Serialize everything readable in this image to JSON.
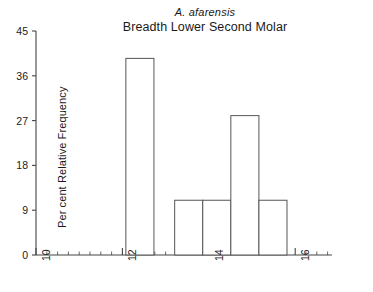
{
  "chart_data": {
    "type": "bar",
    "title": "Breadth Lower Second Molar",
    "subtitle": "A. afarensis",
    "xlabel": "",
    "ylabel": "Per cent Relative Frequency",
    "xlim": [
      10,
      16.85
    ],
    "ylim": [
      0,
      45
    ],
    "grid": false,
    "legend": null,
    "xticks": [
      10,
      12,
      14,
      16
    ],
    "xtick_labels": [
      "10",
      "12",
      "14",
      "16"
    ],
    "yticks": [
      0,
      9,
      18,
      27,
      36,
      45
    ],
    "ytick_labels": [
      "0",
      "9",
      "18",
      "27",
      "36",
      "45"
    ],
    "bin_width": 0.65,
    "bins": [
      {
        "x_start": 12.08,
        "x_end": 12.73,
        "value": 39.5
      },
      {
        "x_start": 13.21,
        "x_end": 13.86,
        "value": 11
      },
      {
        "x_start": 13.86,
        "x_end": 14.51,
        "value": 11
      },
      {
        "x_start": 14.51,
        "x_end": 15.16,
        "value": 28
      },
      {
        "x_start": 15.16,
        "x_end": 15.81,
        "value": 11
      }
    ],
    "categories": [
      "12.08-12.73",
      "13.21-13.86",
      "13.86-14.51",
      "14.51-15.16",
      "15.16-15.81"
    ],
    "values": [
      39.5,
      11,
      11,
      28,
      11
    ],
    "bar_fill_color": "#ffffff",
    "bar_edge_color": "#555555",
    "axis_color": "#444444",
    "text_color": "#1a1a1a"
  }
}
